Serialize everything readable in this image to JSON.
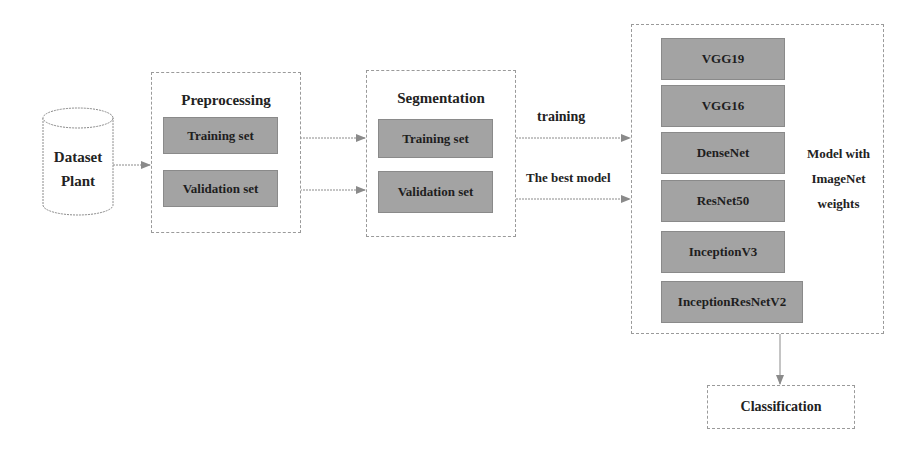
{
  "dataset": {
    "line1": "Dataset",
    "line2": "Plant"
  },
  "preprocessing": {
    "title": "Preprocessing",
    "training": "Training set",
    "validation": "Validation set"
  },
  "segmentation": {
    "title": "Segmentation",
    "training": "Training set",
    "validation": "Validation set"
  },
  "edges": {
    "training_label": "training",
    "best_label": "The best model"
  },
  "models": {
    "items": [
      "VGG19",
      "VGG16",
      "DenseNet",
      "ResNet50",
      "InceptionV3",
      "InceptionResNetV2"
    ],
    "caption": [
      "Model with",
      "ImageNet",
      "weights"
    ]
  },
  "classification": {
    "label": "Classification"
  }
}
